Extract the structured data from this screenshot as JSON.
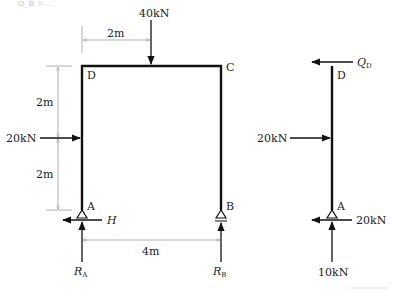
{
  "header_fragment": "Q_B = ...",
  "frame": {
    "nodes": {
      "A": "A",
      "B": "B",
      "C": "C",
      "D": "D"
    },
    "loads": {
      "top_load": "40kN",
      "side_load": "20kN"
    },
    "dimensions": {
      "top_offset": "2m",
      "upper_height": "2m",
      "lower_height": "2m",
      "span": "4m"
    },
    "reactions": {
      "horizontal": "H",
      "ra_main": "R",
      "ra_sub": "A",
      "rb_main": "R",
      "rb_sub": "B"
    }
  },
  "free_body": {
    "top_node": "D",
    "bottom_node": "A",
    "shear_main": "Q",
    "shear_sub": "D",
    "side_load": "20kN",
    "horizontal_reaction": "20kN",
    "vertical_reaction": "10kN"
  },
  "colors": {
    "member": "#111111",
    "dimension": "#9a9a9a",
    "arrow": "#111111"
  }
}
